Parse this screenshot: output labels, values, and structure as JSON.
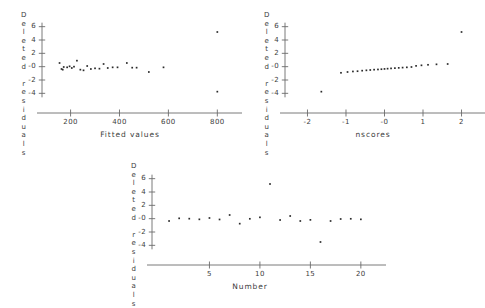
{
  "figure": {
    "title": "",
    "background": "#ffffff",
    "point_color": "#2b2b2b",
    "axis_color": "#6b6b6b"
  },
  "chart_data": [
    {
      "id": "fitted-values-plot",
      "type": "scatter",
      "title": "",
      "xlabel": "Fitted values",
      "ylabel": "Deleted residuals",
      "xlim": [
        120,
        860
      ],
      "ylim": [
        -5,
        7
      ],
      "xticks": [
        200,
        400,
        600,
        800
      ],
      "xticklabels": [
        "200",
        "400",
        "600",
        "800"
      ],
      "yticks": [
        6,
        4,
        2,
        0,
        -2,
        -4
      ],
      "yticklabels": [
        "6",
        "4",
        "2",
        "-0",
        "-2",
        "-4"
      ],
      "grid": false,
      "legend": "none",
      "x": [
        155,
        163,
        168,
        172,
        186,
        196,
        205,
        214,
        226,
        240,
        253,
        268,
        283,
        300,
        318,
        335,
        352,
        372,
        392,
        430,
        452,
        470,
        520,
        580,
        800,
        800
      ],
      "y": [
        0.55,
        -0.35,
        -0.45,
        -0.05,
        -0.1,
        0.05,
        -0.2,
        0.0,
        0.9,
        -0.45,
        -0.55,
        0.1,
        -0.35,
        -0.25,
        -0.3,
        0.4,
        -0.2,
        -0.1,
        -0.1,
        0.55,
        -0.15,
        -0.15,
        -0.8,
        -0.1,
        5.2,
        -3.75
      ]
    },
    {
      "id": "nscores-plot",
      "type": "scatter",
      "title": "",
      "xlabel": "nscores",
      "ylabel": "Deleted residuals",
      "xlim": [
        -2.35,
        2.35
      ],
      "ylim": [
        -5,
        7
      ],
      "xticks": [
        -2,
        -1,
        0,
        1,
        2
      ],
      "xticklabels": [
        "-2",
        "-1",
        "-0",
        "1",
        "2"
      ],
      "yticks": [
        6,
        4,
        2,
        0,
        -2,
        -4
      ],
      "yticklabels": [
        "6",
        "4",
        "2",
        "-0",
        "-2",
        "-4"
      ],
      "grid": false,
      "legend": "none",
      "x": [
        -1.64,
        -1.13,
        -0.96,
        -0.82,
        -0.7,
        -0.58,
        -0.47,
        -0.37,
        -0.27,
        -0.17,
        -0.08,
        0.0,
        0.08,
        0.17,
        0.27,
        0.37,
        0.47,
        0.58,
        0.7,
        0.82,
        0.96,
        1.13,
        1.35,
        1.64,
        2.0
      ],
      "y": [
        -3.75,
        -0.92,
        -0.8,
        -0.72,
        -0.68,
        -0.6,
        -0.55,
        -0.5,
        -0.45,
        -0.42,
        -0.38,
        -0.34,
        -0.3,
        -0.26,
        -0.22,
        -0.18,
        -0.14,
        -0.1,
        -0.05,
        0.12,
        0.2,
        0.28,
        0.35,
        0.4,
        5.2
      ]
    },
    {
      "id": "number-plot",
      "type": "scatter",
      "title": "",
      "xlabel": "Number",
      "ylabel": "Deleted residuals",
      "xlim": [
        0.2,
        21.5
      ],
      "ylim": [
        -5,
        7
      ],
      "xticks": [
        5,
        10,
        15,
        20
      ],
      "xticklabels": [
        "5",
        "10",
        "15",
        "20"
      ],
      "yticks": [
        6,
        4,
        2,
        0,
        -2,
        -4
      ],
      "yticklabels": [
        "6",
        "4",
        "2",
        "-0",
        "-2",
        "-4"
      ],
      "grid": false,
      "legend": "none",
      "x": [
        1,
        2,
        3,
        4,
        5,
        6,
        7,
        8,
        9,
        10,
        11,
        12,
        13,
        14,
        15,
        16,
        17,
        18,
        19,
        20
      ],
      "y": [
        -0.35,
        0.05,
        0.0,
        -0.1,
        0.1,
        -0.12,
        0.55,
        -0.75,
        -0.02,
        0.2,
        5.2,
        -0.2,
        0.4,
        -0.35,
        -0.18,
        -3.5,
        -0.35,
        -0.05,
        -0.02,
        -0.1
      ]
    }
  ]
}
